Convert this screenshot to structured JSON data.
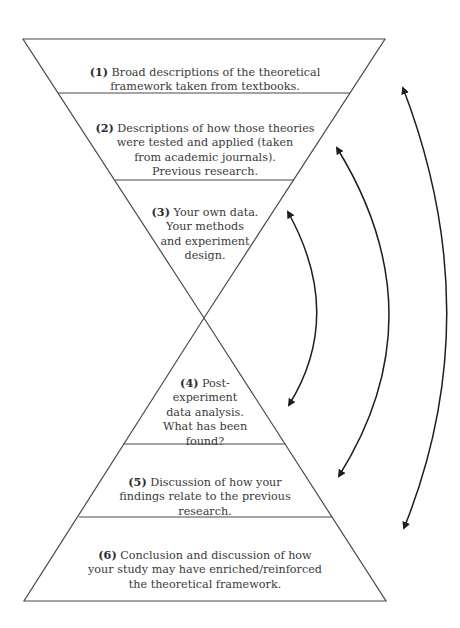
{
  "diagram": {
    "type": "hourglass-research-structure",
    "colors": {
      "stroke": "#4a4a4a",
      "arrow": "#1e1e1e",
      "text": "#3a3a3a",
      "background": "#ffffff"
    },
    "sections": [
      {
        "id": 1,
        "number": "(1)",
        "text": " Broad descriptions of the theoretical\nframework taken from textbooks."
      },
      {
        "id": 2,
        "number": "(2)",
        "text": " Descriptions of how those theories\nwere tested and applied (taken\nfrom academic journals).\nPrevious research."
      },
      {
        "id": 3,
        "number": "(3)",
        "text": " Your own data.\nYour methods\nand experiment\ndesign."
      },
      {
        "id": 4,
        "number": "(4)",
        "text": " Post-\nexperiment\ndata analysis.\nWhat has been\nfound?"
      },
      {
        "id": 5,
        "number": "(5)",
        "text": " Discussion of how your\nfindings relate to the previous\nresearch."
      },
      {
        "id": 6,
        "number": "(6)",
        "text": " Conclusion and discussion of how\nyour study may have enriched/reinforced\nthe theoretical framework."
      }
    ],
    "arrows": [
      {
        "name": "arrow-3-to-4",
        "connects": [
          "(3)",
          "(4)"
        ]
      },
      {
        "name": "arrow-2-to-5",
        "connects": [
          "(2)",
          "(5)"
        ]
      },
      {
        "name": "arrow-1-to-6",
        "connects": [
          "(1)",
          "(6)"
        ]
      }
    ]
  }
}
